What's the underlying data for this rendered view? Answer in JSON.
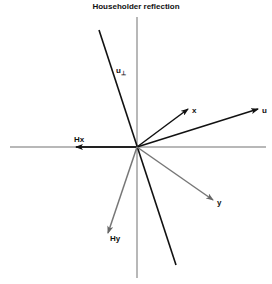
{
  "title": "Householder reflection",
  "labels": {
    "u_perp": "u",
    "u_perp_sub": "⊥",
    "u": "u",
    "x": "x",
    "Hx": "Hx",
    "y": "y",
    "Hy": "Hy"
  },
  "colors": {
    "axis": "#a0a0a0",
    "dark": "#111111",
    "gray_vector": "#777777"
  }
}
